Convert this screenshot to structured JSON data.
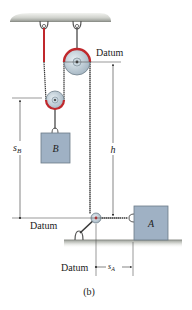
{
  "figure": {
    "caption": "(b)",
    "labels": {
      "datum_top": "Datum",
      "datum_left": "Datum",
      "datum_bottom": "Datum",
      "h": "h",
      "s_b_main": "s",
      "s_b_sub": "B",
      "s_a_main": "s",
      "s_a_sub": "A",
      "block_a": "A",
      "block_b": "B"
    },
    "colors": {
      "rope_highlight": "#c0282c",
      "rope": "#3a3a3a",
      "pulley_fill": "#b9c8d3",
      "block_fill": "#9fb1c4",
      "ceiling": "#c9cbc6",
      "ground": "#c4c7c2",
      "dimension_line": "#333333"
    },
    "elements": [
      "ceiling",
      "left-hook",
      "middle-hook",
      "top-pulley",
      "lower-pulley",
      "block-B",
      "floor-pulley",
      "floor-hook",
      "block-A",
      "ground",
      "datum-lines",
      "dimension-h",
      "dimension-sB",
      "dimension-sA"
    ]
  }
}
